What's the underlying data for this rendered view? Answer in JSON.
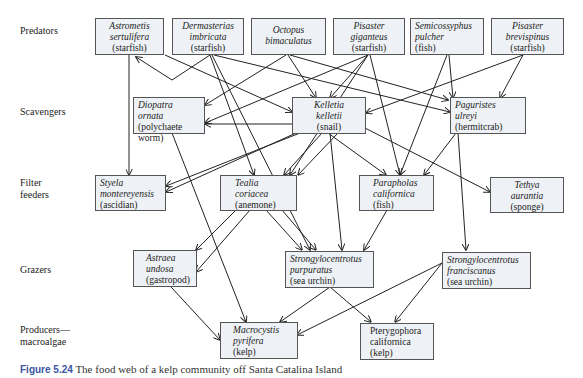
{
  "levels": {
    "predators": "Predators",
    "scavengers": "Scavengers",
    "filter_feeders_1": "Filter",
    "filter_feeders_2": "feeders",
    "grazers": "Grazers",
    "producers_1": "Producers—",
    "producers_2": "macroalgae"
  },
  "nodes": {
    "astrometis": {
      "sci1": "Astrometis",
      "sci2": "sertulifera",
      "common": "(starfish)"
    },
    "dermasterias": {
      "sci1": "Dermasterias",
      "sci2": "imbricata",
      "common": "(starfish)"
    },
    "octopus": {
      "sci1": "Octopus",
      "sci2": "bimaculatus"
    },
    "pisaster_giganteus": {
      "sci1": "Pisaster",
      "sci2": "giganteus",
      "common": "(starfish)"
    },
    "semicossyphus": {
      "sci1": "Semicossyphus",
      "sci2": "pulcher",
      "common": "(fish)"
    },
    "pisaster_brevispinus": {
      "sci1": "Pisaster",
      "sci2": "brevispinus",
      "common": "(starfish)"
    },
    "diopatra": {
      "sci1": "Diopatra ornata",
      "common1": "(polychaete",
      "common2": "worm)"
    },
    "kelletia": {
      "sci1": "Kelletia",
      "sci2": "kelletii",
      "common": "(snail)"
    },
    "paguristes": {
      "sci1": "Paguristes",
      "sci2": "ulreyi",
      "common": "(hermitcrab)"
    },
    "styela": {
      "sci1": "Styela",
      "sci2": "montereyensis",
      "common": "(ascidian)"
    },
    "tealia": {
      "sci1": "Tealia",
      "sci2": "coriacea",
      "common": "(anemone)"
    },
    "parapholas": {
      "sci1": "Parapholas",
      "sci2": "californica",
      "common": "(fish)"
    },
    "tethya": {
      "sci1": "Tethya",
      "sci2": "aurantia",
      "common": "(sponge)"
    },
    "astraea": {
      "sci1": "Astraea",
      "sci2": "undosa",
      "common": "(gastropod)"
    },
    "s_purpuratus": {
      "sci1": "Strongylocentrotus",
      "sci2": "purpuratus",
      "common": "(sea urchin)"
    },
    "s_franciscanus": {
      "sci1": "Strongylocentrotus",
      "sci2": "franciscanus",
      "common": "(sea urchin)"
    },
    "macrocystis": {
      "sci1": "Macrocystis",
      "sci2": "pyrifera",
      "common": "(kelp)"
    },
    "pterygophora": {
      "sci1": "Pterygophora",
      "sci2": "californica",
      "common": "(kelp)"
    }
  },
  "caption": {
    "figure": "Figure 5.24",
    "text": "The food web of a kelp community off Santa Catalina Island"
  },
  "colors": {
    "box_fill": "#eef2f6",
    "box_border": "#555555",
    "edge": "#222222",
    "caption_accent": "#3a55a4"
  }
}
